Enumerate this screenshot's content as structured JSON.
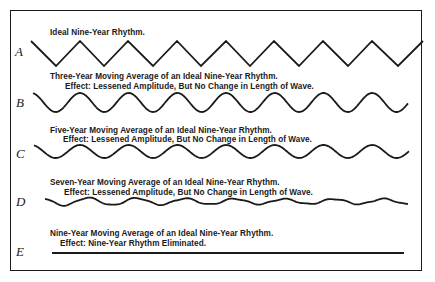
{
  "figure": {
    "panels": [
      {
        "id": "A",
        "label": "A",
        "title": "Ideal Nine-Year Rhythm.",
        "effect": "",
        "wave_type": "zigzag",
        "relative_amplitude": 1.0
      },
      {
        "id": "B",
        "label": "B",
        "title": "Three-Year Moving Average of an Ideal Nine-Year Rhythm.",
        "effect": "Effect: Lessened Amplitude, But No Change in Length of Wave.",
        "wave_type": "sine",
        "relative_amplitude": 0.76
      },
      {
        "id": "C",
        "label": "C",
        "title": "Five-Year Moving Average of an Ideal Nine-Year Rhythm.",
        "effect": "Effect: Lessened Amplitude, But No Change in Length of Wave.",
        "wave_type": "sine",
        "relative_amplitude": 0.52
      },
      {
        "id": "D",
        "label": "D",
        "title": "Seven-Year Moving Average of an Ideal Nine-Year Rhythm.",
        "effect": "Effect: Lessened Amplitude, But No Change in Length of Wave.",
        "wave_type": "sine-irregular",
        "relative_amplitude": 0.28
      },
      {
        "id": "E",
        "label": "E",
        "title": "Nine-Year Moving Average of an Ideal Nine-Year Rhythm.",
        "effect": "Effect: Nine-Year Rhythm Eliminated.",
        "wave_type": "flat",
        "relative_amplitude": 0.0
      }
    ],
    "line_color": "#1a1a1a",
    "background_color": "#ffffff"
  }
}
